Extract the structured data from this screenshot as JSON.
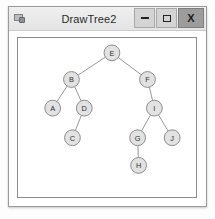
{
  "window": {
    "title": "DrawTree2",
    "app_icon": "application-window-icon",
    "controls": {
      "minimize_label": "–",
      "maximize_label": "□",
      "close_label": "X"
    }
  },
  "colors": {
    "title_bar": "#e9e9e9",
    "close_button": "#9c9c9c",
    "window_border": "#9a9a9a",
    "canvas_background": "#ffffff",
    "canvas_border": "#8d8d8d",
    "node_fill": "#e2e2e2",
    "node_stroke": "#7f7f7f",
    "edge_stroke": "#8b8b8b",
    "label_text": "#2f2f2f"
  },
  "chart_data": {
    "type": "diagram",
    "title": "DrawTree2",
    "diagram_kind": "binary-tree",
    "root": "E",
    "node_radius": 8,
    "viewbox": {
      "width": 180,
      "height": 161
    },
    "nodes": [
      {
        "id": "E",
        "label": "E",
        "x": 95,
        "y": 15,
        "depth": 0
      },
      {
        "id": "B",
        "label": "B",
        "x": 54,
        "y": 42,
        "depth": 1
      },
      {
        "id": "F",
        "label": "F",
        "x": 131,
        "y": 42,
        "depth": 1
      },
      {
        "id": "A",
        "label": "A",
        "x": 35,
        "y": 71,
        "depth": 2
      },
      {
        "id": "D",
        "label": "D",
        "x": 67,
        "y": 71,
        "depth": 2
      },
      {
        "id": "I",
        "label": "I",
        "x": 138,
        "y": 71,
        "depth": 2
      },
      {
        "id": "C",
        "label": "C",
        "x": 55,
        "y": 101,
        "depth": 3
      },
      {
        "id": "G",
        "label": "G",
        "x": 121,
        "y": 101,
        "depth": 3
      },
      {
        "id": "J",
        "label": "J",
        "x": 156,
        "y": 101,
        "depth": 3
      },
      {
        "id": "H",
        "label": "H",
        "x": 122,
        "y": 129,
        "depth": 4
      }
    ],
    "edges": [
      {
        "from": "E",
        "to": "B",
        "side": "left"
      },
      {
        "from": "E",
        "to": "F",
        "side": "right"
      },
      {
        "from": "B",
        "to": "A",
        "side": "left"
      },
      {
        "from": "B",
        "to": "D",
        "side": "right"
      },
      {
        "from": "D",
        "to": "C",
        "side": "left"
      },
      {
        "from": "F",
        "to": "I",
        "side": "right"
      },
      {
        "from": "I",
        "to": "G",
        "side": "left"
      },
      {
        "from": "I",
        "to": "J",
        "side": "right"
      },
      {
        "from": "G",
        "to": "H",
        "side": "left"
      }
    ]
  }
}
